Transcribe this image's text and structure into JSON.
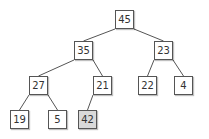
{
  "diagram": {
    "type": "binary-tree",
    "nodes": [
      {
        "id": "n0",
        "value": "45",
        "x": 115,
        "y": 10,
        "highlight": false
      },
      {
        "id": "n1",
        "value": "35",
        "x": 74,
        "y": 41,
        "highlight": false
      },
      {
        "id": "n2",
        "value": "23",
        "x": 154,
        "y": 41,
        "highlight": false
      },
      {
        "id": "n3",
        "value": "27",
        "x": 29,
        "y": 76,
        "highlight": false
      },
      {
        "id": "n4",
        "value": "21",
        "x": 93,
        "y": 76,
        "highlight": false
      },
      {
        "id": "n5",
        "value": "22",
        "x": 138,
        "y": 76,
        "highlight": false
      },
      {
        "id": "n6",
        "value": "4",
        "x": 174,
        "y": 76,
        "highlight": false
      },
      {
        "id": "n7",
        "value": "19",
        "x": 10,
        "y": 110,
        "highlight": false
      },
      {
        "id": "n8",
        "value": "5",
        "x": 48,
        "y": 110,
        "highlight": false
      },
      {
        "id": "n9",
        "value": "42",
        "x": 78,
        "y": 110,
        "highlight": true
      }
    ],
    "edges": [
      [
        "n0",
        "n1"
      ],
      [
        "n0",
        "n2"
      ],
      [
        "n1",
        "n3"
      ],
      [
        "n1",
        "n4"
      ],
      [
        "n2",
        "n5"
      ],
      [
        "n2",
        "n6"
      ],
      [
        "n3",
        "n7"
      ],
      [
        "n3",
        "n8"
      ],
      [
        "n4",
        "n9"
      ]
    ],
    "colors": {
      "border": "#555555",
      "fill": "#ffffff",
      "highlight_fill": "#d9d9d9",
      "edge": "#555555",
      "text": "#333333"
    }
  }
}
